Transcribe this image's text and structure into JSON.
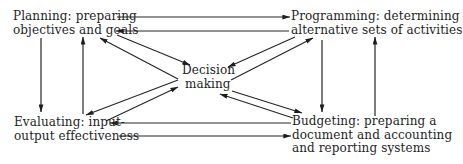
{
  "diagram": {
    "nodes": {
      "planning": {
        "lines": [
          "Planning: preparing",
          "objectives and goals"
        ]
      },
      "programming": {
        "lines": [
          "Programming: determining",
          "alternative sets of activities"
        ]
      },
      "decision": {
        "lines": [
          "Decision",
          "making"
        ]
      },
      "evaluating": {
        "lines": [
          "Evaluating: input-",
          "output effectiveness"
        ]
      },
      "budgeting": {
        "lines": [
          "Budgeting: preparing a",
          "document and accounting",
          "and reporting systems"
        ]
      }
    },
    "edges": [
      {
        "from": "planning",
        "to": "programming"
      },
      {
        "from": "programming",
        "to": "planning"
      },
      {
        "from": "planning",
        "to": "evaluating"
      },
      {
        "from": "evaluating",
        "to": "planning"
      },
      {
        "from": "programming",
        "to": "budgeting"
      },
      {
        "from": "budgeting",
        "to": "programming"
      },
      {
        "from": "budgeting",
        "to": "evaluating"
      },
      {
        "from": "evaluating",
        "to": "budgeting"
      },
      {
        "from": "planning",
        "to": "decision"
      },
      {
        "from": "decision",
        "to": "planning"
      },
      {
        "from": "programming",
        "to": "decision"
      },
      {
        "from": "decision",
        "to": "programming"
      },
      {
        "from": "decision",
        "to": "budgeting"
      },
      {
        "from": "budgeting",
        "to": "decision"
      },
      {
        "from": "evaluating",
        "to": "decision"
      },
      {
        "from": "decision",
        "to": "evaluating"
      }
    ],
    "colors": {
      "ink": "#1e1e1e",
      "background": "#ffffff"
    }
  }
}
